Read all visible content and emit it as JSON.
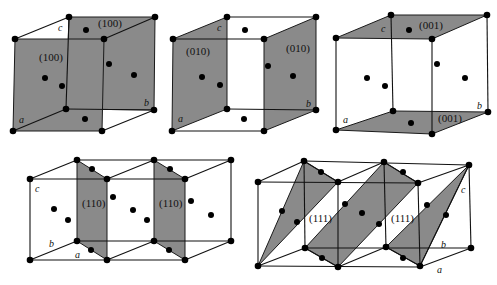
{
  "diagram": {
    "colors": {
      "plane_fill": "#8a8a8a",
      "edge": "#111111",
      "atom": "#000000",
      "background": "#ffffff"
    },
    "panels": [
      {
        "id": "cube-100",
        "plane_labels": [
          "(100)",
          "(100)"
        ],
        "axes": {
          "a": "a",
          "b": "b",
          "c": "c"
        }
      },
      {
        "id": "cube-010",
        "plane_labels": [
          "(010)",
          "(010)"
        ],
        "axes": {
          "a": "a",
          "b": "b",
          "c": "c"
        }
      },
      {
        "id": "cube-001",
        "plane_labels": [
          "(001)",
          "(001)"
        ],
        "axes": {
          "a": "a",
          "b": "b",
          "c": "c"
        }
      },
      {
        "id": "cells-110",
        "plane_labels": [
          "(110)",
          "(110)"
        ],
        "axes": {
          "a": "a",
          "b": "b",
          "c": "c"
        }
      },
      {
        "id": "cells-111",
        "plane_labels": [
          "(111)",
          "(111)"
        ],
        "axes": {
          "a": "a",
          "b": "b",
          "c": "c"
        }
      }
    ]
  }
}
